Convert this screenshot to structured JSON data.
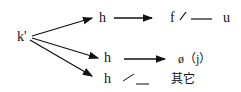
{
  "diagram": {
    "source": {
      "label": "k'"
    },
    "branches": [
      {
        "node": "h",
        "target": "f",
        "environment": "/",
        "blank": "—",
        "context": "u"
      },
      {
        "node": "h",
        "target": "ø（j）"
      },
      {
        "node": "h",
        "environment": "／",
        "blank": "__",
        "context": "其它"
      }
    ]
  }
}
